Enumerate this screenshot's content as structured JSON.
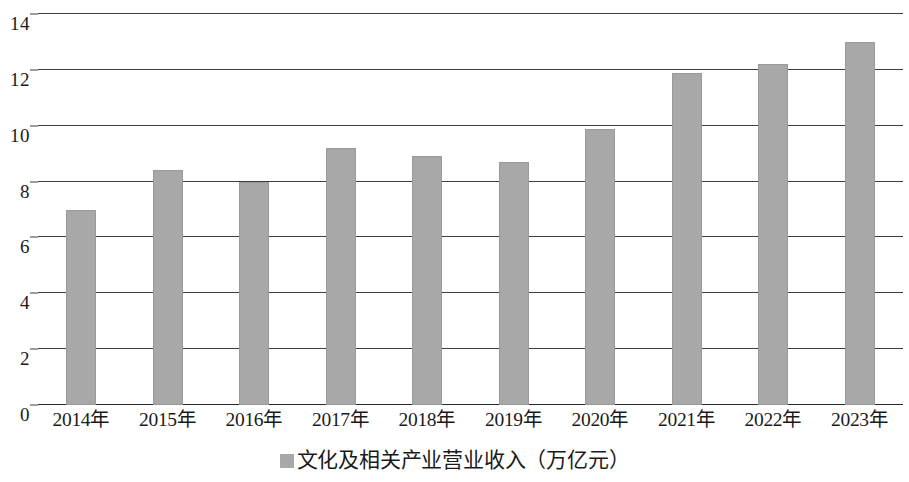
{
  "chart_data": {
    "type": "bar",
    "title": "",
    "subtitle": "",
    "xlabel": "",
    "ylabel": "",
    "categories": [
      "2014年",
      "2015年",
      "2016年",
      "2017年",
      "2018年",
      "2019年",
      "2020年",
      "2021年",
      "2022年",
      "2023年"
    ],
    "series": [
      {
        "name": "文化及相关产业营业收入（万亿元）",
        "values": [
          7.0,
          8.4,
          8.0,
          9.2,
          8.9,
          8.7,
          9.9,
          11.9,
          12.2,
          13.0
        ]
      }
    ],
    "values": [
      7.0,
      8.4,
      8.0,
      9.2,
      8.9,
      8.7,
      9.9,
      11.9,
      12.2,
      13.0
    ],
    "ylim": [
      0,
      14
    ],
    "ytick_values": [
      0,
      2,
      4,
      6,
      8,
      10,
      12,
      14
    ],
    "ytick_labels": [
      "0",
      "2",
      "4",
      "6",
      "8",
      "10",
      "12",
      "14"
    ],
    "grid": true,
    "grid_axis": "y",
    "legend_position": "bottom-center",
    "bar_color": "#a8a8a8",
    "gridline_color": "#3c3c3c",
    "text_color": "#1a1a1a"
  },
  "legend": {
    "entries": [
      {
        "label": "文化及相关产业营业收入（万亿元）",
        "color": "#a8a8a8",
        "marker": "square-marker"
      }
    ]
  }
}
